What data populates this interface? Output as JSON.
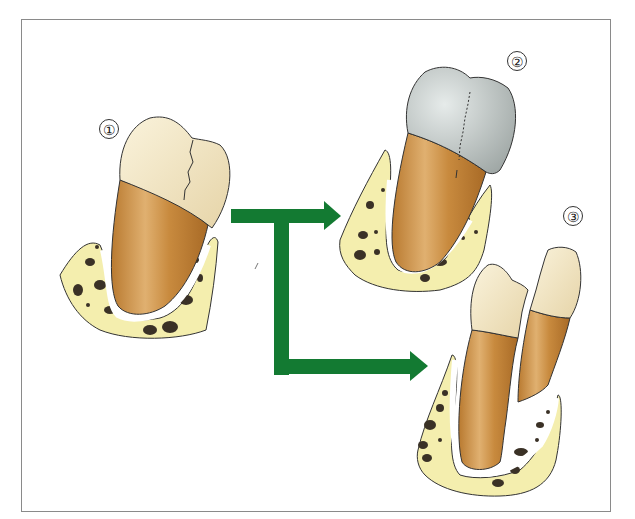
{
  "figure": {
    "type": "dental illustration",
    "labels": [
      {
        "id": "1",
        "text": "①",
        "caption": "cracked tooth"
      },
      {
        "id": "2",
        "text": "②",
        "caption": "tooth restored with crown"
      },
      {
        "id": "3",
        "text": "③",
        "caption": "split tooth"
      }
    ],
    "colors": {
      "arrow": "#137a32",
      "bone": "#f4eeae",
      "bone_pores": "#3a3126",
      "root": "#c58a3c",
      "enamel": "#efe4c4",
      "crown": "#bcc3c1",
      "outline": "#333333",
      "frame_border": "#8a8a8a"
    }
  }
}
